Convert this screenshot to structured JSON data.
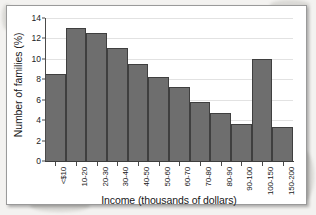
{
  "chart_data": {
    "type": "bar",
    "title": "",
    "xlabel": "Income (thousands of dollars)",
    "ylabel": "Number of families (%)",
    "categories": [
      "<$10",
      "10-20",
      "20-30",
      "30-40",
      "40-50",
      "50-60",
      "60-70",
      "70-80",
      "80-90",
      "90-100",
      "100-150",
      "150-200"
    ],
    "values": [
      8.5,
      13.0,
      12.5,
      11.1,
      9.5,
      8.2,
      7.2,
      5.8,
      4.7,
      3.65,
      10.0,
      3.3
    ],
    "ylim": [
      0,
      14
    ],
    "yticks": [
      0,
      2,
      4,
      6,
      8,
      10,
      12,
      14
    ],
    "ytick_labels": [
      "0",
      "2",
      "4",
      "6",
      "8",
      "10",
      "12",
      "14"
    ],
    "grid": true,
    "grid_axis": "y",
    "legend": false,
    "bar_color": "#6e6e6e",
    "bar_edge_color": "#3f3f3f",
    "axis_color": "#3d3d3d",
    "gridline_color": "#e2e2e2",
    "background_color": "#ffffff",
    "xtick_label_rotation": -90
  }
}
